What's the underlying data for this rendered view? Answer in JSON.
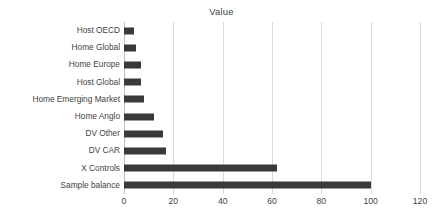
{
  "chart_data": {
    "type": "bar",
    "orientation": "horizontal",
    "title": "Value",
    "xlabel": "",
    "ylabel": "",
    "xlim": [
      0,
      120
    ],
    "xticks": [
      "0",
      "20",
      "40",
      "60",
      "80",
      "100",
      "120"
    ],
    "xtick_values": [
      0,
      20,
      40,
      60,
      80,
      100,
      120
    ],
    "grid": "vertical",
    "legend": "none",
    "bar_color": "#3a3a3a",
    "gridline_color": "#d9d9d9",
    "categories": [
      "Host OECD",
      "Home Global",
      "Home Europe",
      "Host Global",
      "Home Emerging Market",
      "Home Anglo",
      "DV Other",
      "DV CAR",
      "X Controls",
      "Sample balance"
    ],
    "values": [
      4,
      5,
      7,
      7,
      8,
      12,
      16,
      17,
      62,
      100
    ],
    "series": [
      {
        "name": "Value",
        "values": [
          4,
          5,
          7,
          7,
          8,
          12,
          16,
          17,
          62,
          100
        ]
      }
    ]
  }
}
